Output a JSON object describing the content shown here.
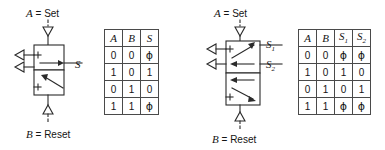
{
  "figure": {
    "left_circuit": {
      "top_label": {
        "signal": "A",
        "equals": " = ",
        "function": "Set"
      },
      "bottom_label": {
        "signal": "B",
        "equals": " = ",
        "function": "Reset"
      },
      "output_ports": [
        {
          "name": "S",
          "sub": ""
        }
      ],
      "symbol_type": "memory-valve-single-output",
      "positions": 2
    },
    "left_table": {
      "headers": [
        {
          "text": "A",
          "sub": ""
        },
        {
          "text": "B",
          "sub": ""
        },
        {
          "text": "S",
          "sub": ""
        }
      ],
      "rows": [
        [
          "0",
          "0",
          "ϕ"
        ],
        [
          "1",
          "0",
          "1"
        ],
        [
          "0",
          "1",
          "0"
        ],
        [
          "1",
          "1",
          "ϕ"
        ]
      ]
    },
    "right_circuit": {
      "top_label": {
        "signal": "A",
        "equals": " = ",
        "function": "Set"
      },
      "bottom_label": {
        "signal": "B",
        "equals": " = ",
        "function": "Reset"
      },
      "output_ports": [
        {
          "name": "S",
          "sub": "1"
        },
        {
          "name": "S",
          "sub": "2"
        }
      ],
      "symbol_type": "memory-valve-dual-output",
      "positions": 2
    },
    "right_table": {
      "headers": [
        {
          "text": "A",
          "sub": ""
        },
        {
          "text": "B",
          "sub": ""
        },
        {
          "text": "S",
          "sub": "1"
        },
        {
          "text": "S",
          "sub": "2"
        }
      ],
      "rows": [
        [
          "0",
          "0",
          "ϕ",
          "ϕ"
        ],
        [
          "1",
          "0",
          "1",
          "0"
        ],
        [
          "0",
          "1",
          "0",
          "1"
        ],
        [
          "1",
          "1",
          "ϕ",
          "ϕ"
        ]
      ]
    },
    "colors": {
      "line": "#2b2b2b",
      "table_border": "#4a4a4a",
      "text": "#141414",
      "background": "#ffffff"
    }
  }
}
